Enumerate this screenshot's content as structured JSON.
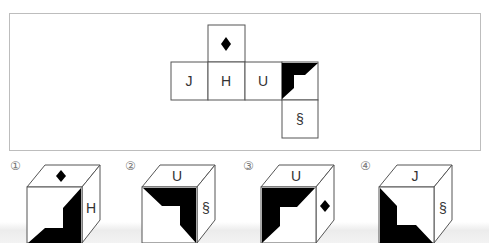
{
  "net": {
    "faces": [
      {
        "id": "top",
        "symbol": "diamond",
        "label": ""
      },
      {
        "id": "j",
        "label": "J"
      },
      {
        "id": "h",
        "label": "H"
      },
      {
        "id": "u",
        "label": "U"
      },
      {
        "id": "shaded",
        "symbol": "black-corner-pattern",
        "label": ""
      },
      {
        "id": "section",
        "label": "§"
      }
    ]
  },
  "options": [
    {
      "number": "①",
      "top": "◆",
      "right": "H",
      "front": "black-pattern"
    },
    {
      "number": "②",
      "top": "U",
      "right": "§",
      "front": "black-pattern"
    },
    {
      "number": "③",
      "top": "U",
      "right": "◆",
      "front": "black-pattern"
    },
    {
      "number": "④",
      "top": "J",
      "right": "§",
      "front": "black-pattern"
    }
  ],
  "colors": {
    "stroke": "#555555",
    "fill": "#000000",
    "frame": "#bdbdbd"
  }
}
